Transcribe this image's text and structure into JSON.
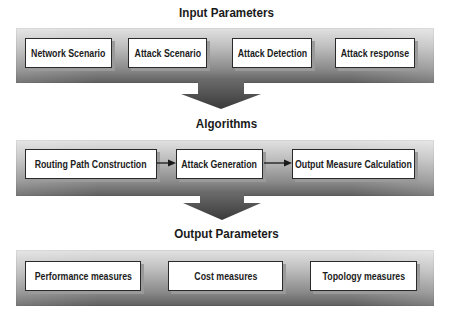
{
  "sections": [
    {
      "title": "Input Parameters",
      "boxes": [
        "Network Scenario",
        "Attack Scenario",
        "Attack Detection",
        "Attack response"
      ]
    },
    {
      "title": "Algorithms",
      "boxes": [
        "Routing Path Construction",
        "Attack Generation",
        "Output Measure Calculation"
      ]
    },
    {
      "title": "Output Parameters",
      "boxes": [
        "Performance measures",
        "Cost measures",
        "Topology measures"
      ]
    }
  ],
  "colors": {
    "arrow": "#4a4a4a",
    "box_border": "#2a2a2a",
    "panel_light": "#e2e2e2",
    "panel_dark": "#5e5e5e"
  }
}
